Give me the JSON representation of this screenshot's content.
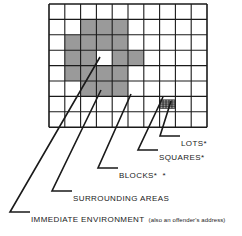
{
  "diagram": {
    "type": "hierarchical-spatial-grid",
    "grid": {
      "cols": 10,
      "rows": 8,
      "x": 49,
      "y": 4,
      "cell_w": 15.8,
      "cell_h": 15.4,
      "line_color": "#1a1a1a",
      "cell_fill": "#ffffff",
      "shaded_fill": "#9a9a9a",
      "shaded_cells": [
        [
          1,
          2
        ],
        [
          1,
          3
        ],
        [
          1,
          4
        ],
        [
          2,
          1
        ],
        [
          2,
          2
        ],
        [
          2,
          3
        ],
        [
          2,
          4
        ],
        [
          3,
          1
        ],
        [
          3,
          2
        ],
        [
          3,
          4
        ],
        [
          3,
          5
        ],
        [
          4,
          1
        ],
        [
          4,
          2
        ],
        [
          4,
          3
        ],
        [
          4,
          4
        ],
        [
          5,
          2
        ],
        [
          5,
          3
        ],
        [
          5,
          4
        ]
      ],
      "immediate_environment_cell": [
        3,
        3
      ],
      "fine_mesh_cell": [
        6,
        7
      ],
      "fine_mesh": {
        "cols": 5,
        "rows": 4
      }
    }
  },
  "labels": {
    "lots": {
      "text": "LOTS",
      "stars": "*"
    },
    "squares": {
      "text": "SQUARES",
      "stars": "*"
    },
    "blocks": {
      "text": "BLOCKS",
      "stars": "* *"
    },
    "surrounding_areas": {
      "text": "SURROUNDING AREAS",
      "stars": ""
    },
    "immediate_environment": {
      "text": "IMMEDIATE ENVIRONMENT",
      "note": "(also an offender's address)"
    }
  },
  "colors": {
    "ink": "#1a1a1a",
    "shade": "#9a9a9a",
    "paper": "#ffffff"
  }
}
